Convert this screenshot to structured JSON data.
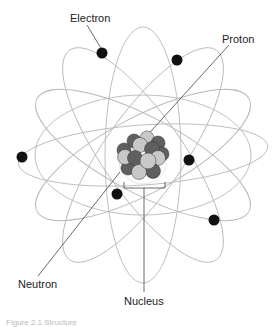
{
  "diagram": {
    "labels": {
      "electron": "Electron",
      "proton": "Proton",
      "neutron": "Neutron",
      "nucleus": "Nucleus"
    },
    "caption": "Figure 2.1 Structure",
    "colors": {
      "orbit": "#b5b5b5",
      "electron": "#111111",
      "proton": "#c8c8c8",
      "neutron": "#5f5f5f",
      "leader_line": "#444444"
    }
  }
}
